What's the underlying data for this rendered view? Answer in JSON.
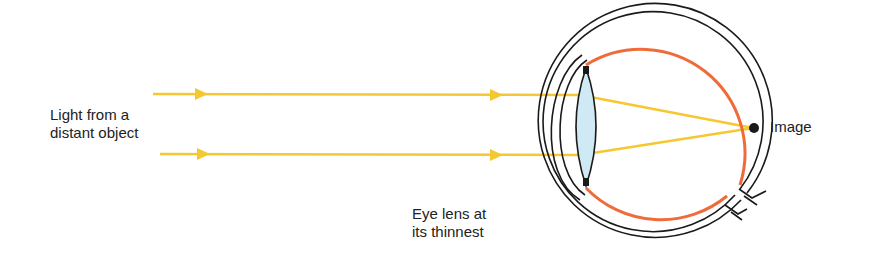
{
  "diagram": {
    "labels": {
      "source_line1": "Light from a",
      "source_line2": "distant object",
      "image": "Image",
      "lens_line1": "Eye lens at",
      "lens_line2": "its thinnest"
    },
    "colors": {
      "ray": "#f5c832",
      "retina": "#ef6c3a",
      "outline": "#1a1a1a",
      "lens_fill": "#cfeaf4",
      "text": "#222222"
    }
  }
}
